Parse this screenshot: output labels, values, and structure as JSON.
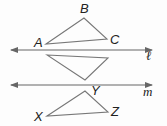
{
  "diagram": {
    "colors": {
      "line": "#666666",
      "triangle": "#777777",
      "text": "#222222",
      "background": "#fdfdfd"
    },
    "lines": [
      {
        "name": "l",
        "label": "ℓ",
        "y": 50,
        "x1": 11,
        "x2": 152,
        "arrows": "both"
      },
      {
        "name": "m",
        "label": "m",
        "y": 85,
        "x1": 11,
        "x2": 152,
        "arrows": "both"
      }
    ],
    "triangles": [
      {
        "name": "ABC",
        "vertices": [
          {
            "label": "A",
            "x": 46,
            "y": 44
          },
          {
            "label": "B",
            "x": 84,
            "y": 18
          },
          {
            "label": "C",
            "x": 107,
            "y": 39
          }
        ]
      },
      {
        "name": "reflected-image",
        "vertices": [
          {
            "label": "",
            "x": 47,
            "y": 55
          },
          {
            "label": "",
            "x": 108,
            "y": 58
          },
          {
            "label": "",
            "x": 85,
            "y": 80
          }
        ]
      },
      {
        "name": "XYZ",
        "vertices": [
          {
            "label": "X",
            "x": 47,
            "y": 116
          },
          {
            "label": "Y",
            "x": 85,
            "y": 91
          },
          {
            "label": "Z",
            "x": 108,
            "y": 112
          }
        ]
      }
    ],
    "labels": {
      "A": "A",
      "B": "B",
      "C": "C",
      "X": "X",
      "Y": "Y",
      "Z": "Z",
      "line_l": "ℓ",
      "line_m": "m"
    }
  }
}
